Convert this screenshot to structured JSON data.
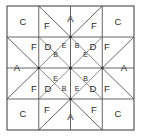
{
  "figure": {
    "grid": {
      "rows": 4,
      "cols": 4
    },
    "colors": {
      "background": "#ffffff",
      "patch_fill": "#ffffff",
      "seam_line": "#555555",
      "frame_line": "#4a4a4a",
      "label_text": "#2b2b2b"
    }
  },
  "patches": {
    "corner_top_left": "C",
    "corner_top_right": "C",
    "corner_bottom_left": "C",
    "corner_bottom_right": "C",
    "top_left_F": "F",
    "top_center_A": "A",
    "top_right_F": "F",
    "bottom_left_F": "F",
    "bottom_center_A": "A",
    "bottom_right_F": "F",
    "left_upper_F": "F",
    "left_upper_D": "D",
    "left_center_A": "A",
    "left_lower_F": "F",
    "left_lower_D": "D",
    "right_upper_D": "D",
    "right_upper_F": "F",
    "right_center_A": "A",
    "right_lower_D": "D",
    "right_lower_F": "F",
    "center_tl_E": "E",
    "center_tl_B": "B",
    "center_tr_B": "B",
    "center_tr_E": "E",
    "center_bl_E": "E",
    "center_bl_B": "B",
    "center_br_B": "B",
    "center_br_E": "E"
  },
  "legend_letters": [
    "A",
    "B",
    "C",
    "D",
    "E",
    "F"
  ]
}
